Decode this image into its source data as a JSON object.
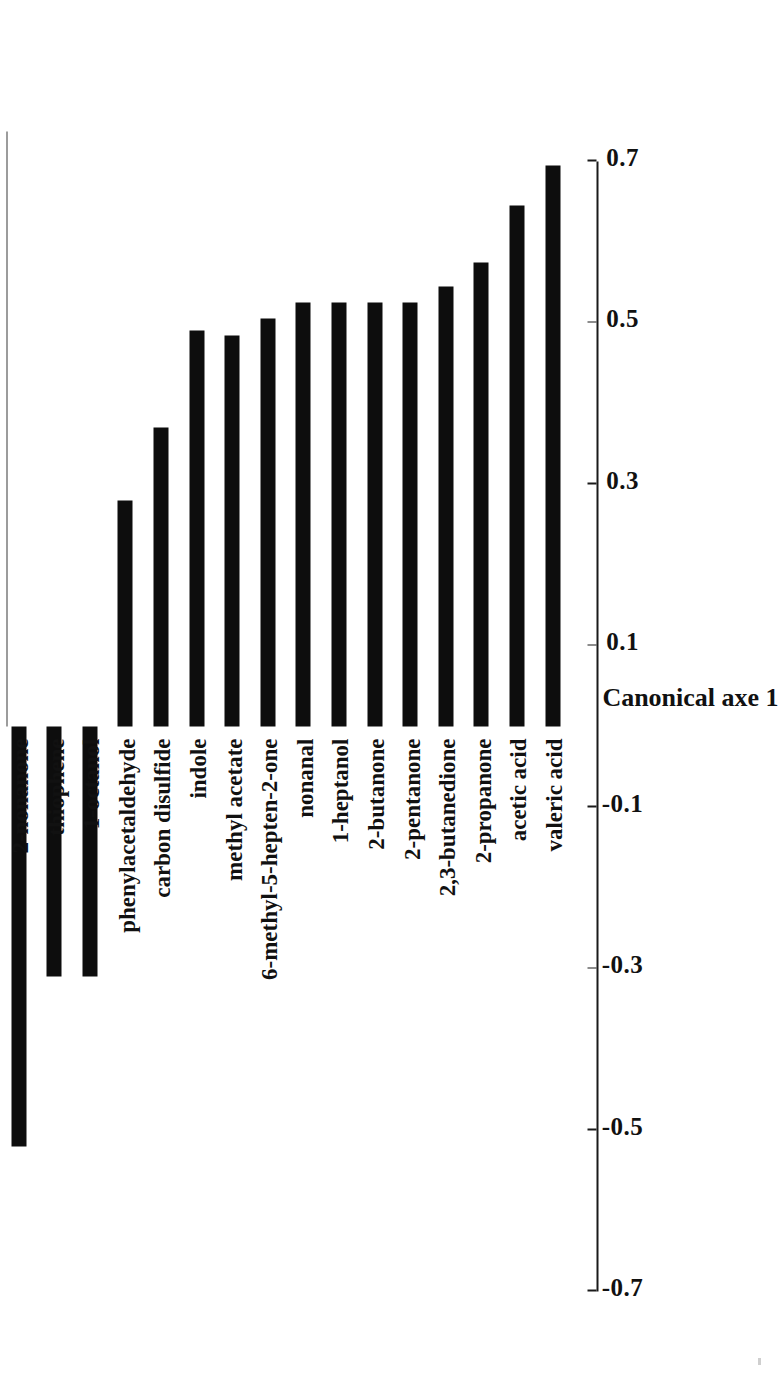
{
  "chart_data": {
    "type": "bar",
    "orientation": "horizontal-rotated",
    "title": "",
    "xlabel": "Canonical axe 1",
    "ylabel": "",
    "xlim": [
      -0.7,
      0.7
    ],
    "grid": false,
    "legend": null,
    "tick_labels": [
      "-0.7",
      "-0.5",
      "-0.3",
      "-0.1",
      "0.1",
      "0.3",
      "0.5",
      "0.7"
    ],
    "tick_values": [
      -0.7,
      -0.5,
      -0.3,
      -0.1,
      0.1,
      0.3,
      0.5,
      0.7
    ],
    "bar_color": "#0d0d0d",
    "categories": [
      "2-nonanone",
      "thiophene",
      "1-octanol",
      "phenylacetaldehyde",
      "carbon disulfide",
      "indole",
      "methyl acetate",
      "6-methyl-5-hepten-2-one",
      "nonanal",
      "1-heptanol",
      "2-butanone",
      "2-pentanone",
      "2,3-butanedione",
      "2-propanone",
      "acetic acid",
      "valeric acid"
    ],
    "values": [
      -0.52,
      -0.31,
      -0.31,
      0.28,
      0.37,
      0.49,
      0.485,
      0.505,
      0.525,
      0.525,
      0.525,
      0.525,
      0.545,
      0.575,
      0.645,
      0.695
    ]
  },
  "axis": {
    "title": "Canonical axe 1"
  }
}
